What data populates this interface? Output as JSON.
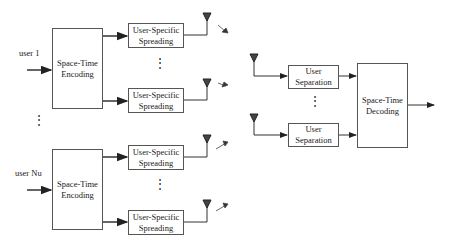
{
  "transmitters": [
    {
      "user_label": "user 1",
      "encoder": "Space-Time Encoding",
      "spreading": [
        "User-Specific Spreading",
        "User-Specific Spreading"
      ]
    },
    {
      "user_label": "user Nu",
      "encoder": "Space-Time Encoding",
      "spreading": [
        "User-Specific Spreading",
        "User-Specific Spreading"
      ]
    }
  ],
  "receiver": {
    "separation": [
      "User Separation",
      "User Separation"
    ],
    "decoder": "Space-Time Decoding"
  },
  "dots": "⋮"
}
